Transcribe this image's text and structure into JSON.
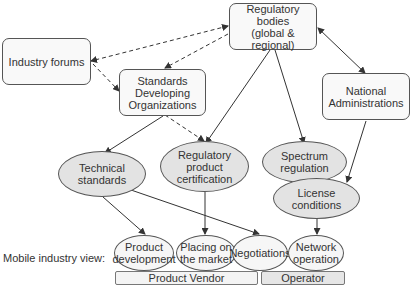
{
  "nodes": {
    "industry_forums": "Industry forums",
    "regulatory_bodies": [
      "Regulatory",
      "bodies",
      "(global & regional)"
    ],
    "sdo": [
      "Standards",
      "Developing",
      "Organizations"
    ],
    "national_admin": [
      "National",
      "Administrations"
    ],
    "technical_standards": [
      "Technical",
      "standards"
    ],
    "reg_product_cert": [
      "Regulatory",
      "product",
      "certification"
    ],
    "spectrum_regulation": [
      "Spectrum",
      "regulation"
    ],
    "license_conditions": [
      "License",
      "conditions"
    ]
  },
  "activities": {
    "product_development": [
      "Product",
      "development"
    ],
    "placing_on_market": [
      "Placing on",
      "the market"
    ],
    "negotiations": "Negotiations",
    "network_operation": [
      "Network",
      "operation"
    ]
  },
  "bars": {
    "product_vendor": "Product Vendor",
    "operator": "Operator"
  },
  "row_label": "Mobile industry view:",
  "colors": {
    "box_fill": "#f9f9f9",
    "ellipse_fill": "#e3e3e3",
    "vendor_bar": "#f4f4f4",
    "operator_bar": "#e6e6e6",
    "line": "#333333"
  }
}
